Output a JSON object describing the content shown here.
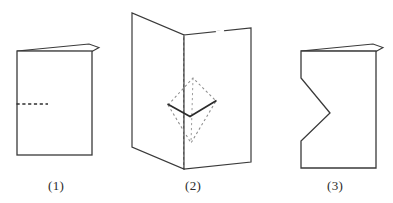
{
  "figure": {
    "background_color": "#ffffff",
    "stroke_color": "#3a3a3a",
    "dashed_color": "#707070",
    "panels": [
      {
        "id": "panel-1",
        "caption": "(1)",
        "description": "Folded card seen closed: upright rectangle with a thin slanted flap along the top edge and a short horizontal dashed cut line entering from the left side at mid height.",
        "elements": {
          "body_rect": {
            "x": 17,
            "y": 51,
            "width": 75,
            "height": 104
          },
          "top_flap": {
            "points": "17,51 89,44 99,47 92,51"
          },
          "dashed_cut": {
            "x1": 17,
            "y1": 104,
            "x2": 48,
            "y2": 104
          }
        }
      },
      {
        "id": "panel-2",
        "caption": "(2)",
        "description": "Same card opened out to form a standing V: the top and bottom edges chevron down to a central vertical dashed fold, and a kite shaped flap is pushed through the middle, its solid creases shown as a downward V with dashed hidden edges above and below.",
        "elements": {
          "left_panel": {
            "points": "132,13 132,147 184,169 184,35"
          },
          "right_panel": {
            "points": "251,28 251,162 184,169 184,35"
          },
          "center_fold_dashed": {
            "x1": 184,
            "y1": 35,
            "x2": 184,
            "y2": 169
          },
          "kite_apex": {
            "x": 193,
            "y": 78
          },
          "kite_left": {
            "x": 168,
            "y": 105
          },
          "kite_right": {
            "x": 216,
            "y": 101
          },
          "kite_bottom": {
            "x": 191,
            "y": 143
          },
          "kite_solid_v": "168,105 190,116 216,101"
        }
      },
      {
        "id": "panel-3",
        "caption": "(3)",
        "description": "The unfolded result: upright rectangle with the same thin slanted top flap, and a V shaped notch cut into the left edge pointing toward the centre of the sheet.",
        "elements": {
          "body_outline": "301,51 301,78 330,113 301,141 301,168 376,168 376,51",
          "top_flap": {
            "points": "301,51 373,44 383,47 376,51"
          },
          "notch_vertex": {
            "x": 330,
            "y": 113
          }
        }
      }
    ],
    "captions": {
      "one": "(1)",
      "two": "(2)",
      "three": "(3)"
    }
  }
}
